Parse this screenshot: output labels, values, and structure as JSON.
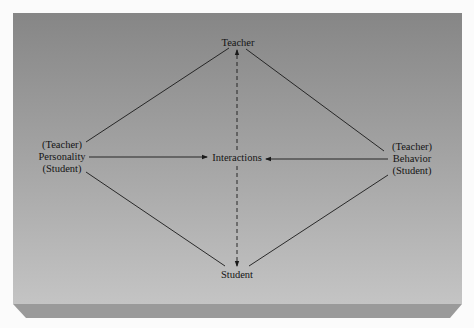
{
  "diagram": {
    "type": "relationship-diagram",
    "colors": {
      "panel_top": "#878787",
      "panel_bottom": "#c3c3c3",
      "bevel": "#9a9a9a",
      "line": "#1a1a1a",
      "background": "#fbfbfb"
    },
    "nodes": {
      "teacher": {
        "label": "Teacher"
      },
      "student": {
        "label": "Student"
      },
      "interactions": {
        "label": "Interactions"
      },
      "personality": {
        "top": "(Teacher)",
        "label": "Personality",
        "bottom": "(Student)"
      },
      "behavior": {
        "top": "(Teacher)",
        "label": "Behavior",
        "bottom": "(Student)"
      }
    },
    "edges": [
      {
        "from": "teacher",
        "to": "personality",
        "style": "solid"
      },
      {
        "from": "teacher",
        "to": "behavior",
        "style": "solid"
      },
      {
        "from": "personality",
        "to": "student",
        "style": "solid"
      },
      {
        "from": "behavior",
        "to": "student",
        "style": "solid"
      },
      {
        "from": "personality",
        "to": "interactions",
        "style": "solid-arrow"
      },
      {
        "from": "behavior",
        "to": "interactions",
        "style": "solid-arrow"
      },
      {
        "from": "teacher",
        "to": "student",
        "style": "dashed-bidirectional"
      }
    ]
  }
}
